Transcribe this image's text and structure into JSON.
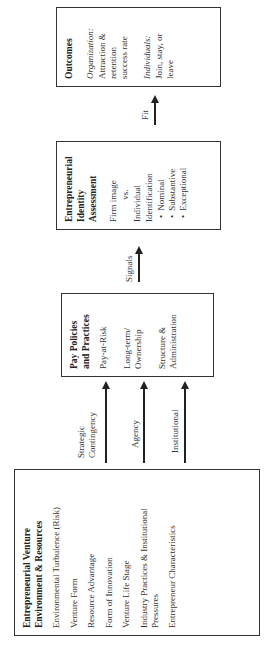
{
  "diagram": {
    "orientation": "rotated -90 degrees",
    "boxes": {
      "environment": {
        "title_line1": "Entrepreneurial Venture",
        "title_line2": "Environment & Resources",
        "items": [
          "Environmental Turbulence (Risk)",
          "Venture Form",
          "Resource Advantage",
          "Form of Innovation",
          "Venture Life Stage",
          "Industry Practices & Institutional Pressures",
          "Entrepreneur Characteristics"
        ]
      },
      "pay": {
        "title_line1": "Pay Policies",
        "title_line2": "and Practices",
        "items": [
          "Pay-at-Risk",
          "Long-term/ Ownership",
          "Structure & Administration"
        ]
      },
      "identity": {
        "title_line1": "Entrepreneurial",
        "title_line2": "Identity",
        "title_line3": "Assessment",
        "line1": "Firm image",
        "line2": "vs.",
        "line3": "Individual",
        "line4": "Identification",
        "bullets": [
          "Nominal",
          "Substantive",
          "Exceptional"
        ]
      },
      "outcomes": {
        "title": "Outcomes",
        "org_label": "Organization:",
        "org_text": "Attraction & retention success rate",
        "ind_label": "Individuals:",
        "ind_text": "Join, stay, or leave"
      }
    },
    "arrows": {
      "strategic": "Strategic Contingency",
      "agency": "Agency",
      "institutional": "Institutional",
      "signals": "Signals",
      "fit": "Fit"
    }
  }
}
